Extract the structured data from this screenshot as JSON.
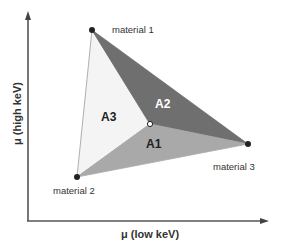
{
  "diagram": {
    "axes": {
      "x_label": "μ (low keV)",
      "y_label": "μ (high keV)"
    },
    "vertices": [
      {
        "id": "m1",
        "label": "material 1",
        "x": 92,
        "y": 30
      },
      {
        "id": "m2",
        "label": "material 2",
        "x": 77,
        "y": 177
      },
      {
        "id": "m3",
        "label": "material 3",
        "x": 248,
        "y": 144
      }
    ],
    "center_point": {
      "x": 150,
      "y": 124
    },
    "regions": [
      {
        "id": "A1",
        "label": "A1",
        "color": "#a9a9a9"
      },
      {
        "id": "A2",
        "label": "A2",
        "color": "#6f6f6f"
      },
      {
        "id": "A3",
        "label": "A3",
        "color": "#f4f4f4"
      }
    ],
    "colors": {
      "axis": "#555555",
      "text": "#333333",
      "vertex_dot": "#222222",
      "edge": "#888888"
    }
  }
}
